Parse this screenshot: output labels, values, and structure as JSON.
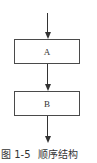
{
  "diagram": {
    "type": "flowchart",
    "structure": "sequential",
    "nodes": [
      {
        "id": "A",
        "label": "A"
      },
      {
        "id": "B",
        "label": "B"
      }
    ],
    "edges": [
      {
        "from": "entry",
        "to": "A"
      },
      {
        "from": "A",
        "to": "B"
      },
      {
        "from": "B",
        "to": "exit"
      }
    ],
    "colors": {
      "stroke": "#333333",
      "box_border": "#4a4a4a",
      "background": "#ffffff",
      "text": "#333333"
    }
  },
  "caption": {
    "figure_label": "图 1-5",
    "title": "顺序结构"
  }
}
